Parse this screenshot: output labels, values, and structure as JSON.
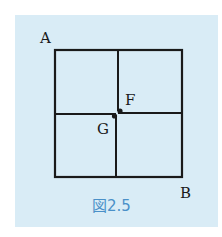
{
  "figure": {
    "caption": "図2.5",
    "background_color": "#d9ecf6",
    "line_color": "#1a1a1a",
    "caption_color": "#4a90c8",
    "grid": {
      "rows": 2,
      "cols": 2
    },
    "points": {
      "A": "A",
      "B": "B",
      "F": "F",
      "G": "G"
    }
  }
}
